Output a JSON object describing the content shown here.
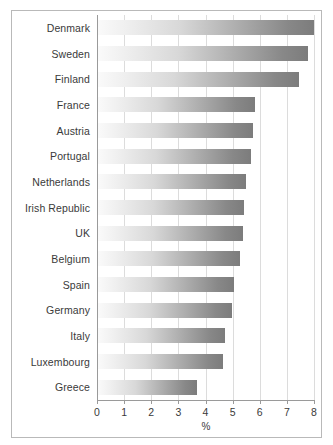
{
  "chart_data": {
    "type": "bar",
    "orientation": "horizontal",
    "title": "",
    "subtitle": "",
    "xlabel": "%",
    "ylabel": "",
    "xlim": [
      0,
      8
    ],
    "xticks": [
      0,
      1,
      2,
      3,
      4,
      5,
      6,
      7,
      8
    ],
    "xtick_labels": [
      "0",
      "1",
      "2",
      "3",
      "4",
      "5",
      "6",
      "7",
      "8"
    ],
    "grid": "vertical",
    "legend": "none",
    "categories": [
      "Denmark",
      "Sweden",
      "Finland",
      "France",
      "Austria",
      "Portugal",
      "Netherlands",
      "Irish Republic",
      "UK",
      "Belgium",
      "Spain",
      "Germany",
      "Italy",
      "Luxembourg",
      "Greece"
    ],
    "values": [
      7.95,
      7.75,
      7.4,
      5.8,
      5.7,
      5.65,
      5.45,
      5.4,
      5.35,
      5.25,
      5.0,
      4.95,
      4.7,
      4.6,
      3.65
    ],
    "bar_fill": {
      "style": "horizontal-gradient",
      "from": "#fafafa",
      "to": "#7c7c7c"
    },
    "colors": {
      "gridline": "#dcdcdc",
      "axis": "#9a9a9a",
      "text": "#3a3a3a",
      "frame": "#b9b9b9",
      "background": "#ffffff"
    }
  }
}
